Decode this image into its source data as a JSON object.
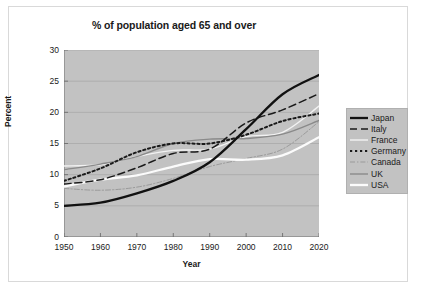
{
  "chart_data": {
    "type": "line",
    "title": "% of population aged 65 and over",
    "xlabel": "Year",
    "ylabel": "Percent",
    "x": [
      1950,
      1960,
      1970,
      1980,
      1990,
      2000,
      2010,
      2020
    ],
    "xlim": [
      1950,
      2020
    ],
    "ylim": [
      0,
      30
    ],
    "xticks": [
      "1950",
      "1960",
      "1970",
      "1980",
      "1990",
      "2000",
      "2010",
      "2020"
    ],
    "yticks": [
      "0",
      "5",
      "10",
      "15",
      "20",
      "25",
      "30"
    ],
    "grid": "horizontal",
    "legend_position": "right",
    "series": [
      {
        "name": "Japan",
        "style": "solid-thick",
        "color": "#111111",
        "values": [
          5.0,
          5.5,
          7.0,
          9.0,
          12.0,
          17.3,
          22.9,
          26.0
        ]
      },
      {
        "name": "Italy",
        "style": "dashed",
        "color": "#1a1a1a",
        "values": [
          8.5,
          9.2,
          11.1,
          13.4,
          14.1,
          18.3,
          20.4,
          23.0
        ]
      },
      {
        "name": "France",
        "style": "solid",
        "color": "#f2f2f2",
        "values": [
          11.4,
          11.6,
          12.9,
          13.9,
          14.1,
          16.1,
          16.8,
          21.0
        ]
      },
      {
        "name": "Germany",
        "style": "dotted",
        "color": "#1a1a1a",
        "values": [
          9.0,
          11.0,
          13.6,
          15.0,
          15.0,
          16.4,
          18.6,
          19.8
        ]
      },
      {
        "name": "Canada",
        "style": "dash-dot",
        "color": "#9a9a9a",
        "values": [
          7.8,
          7.5,
          8.0,
          9.4,
          11.3,
          12.6,
          14.1,
          18.5
        ]
      },
      {
        "name": "UK",
        "style": "solid",
        "color": "#8a8a8a",
        "values": [
          10.8,
          11.7,
          12.9,
          15.0,
          15.7,
          15.8,
          16.5,
          18.7
        ]
      },
      {
        "name": "USA",
        "style": "solid-thick",
        "color": "#fbfbfb",
        "values": [
          8.1,
          9.2,
          9.9,
          11.3,
          12.5,
          12.4,
          13.1,
          16.0
        ]
      }
    ]
  }
}
